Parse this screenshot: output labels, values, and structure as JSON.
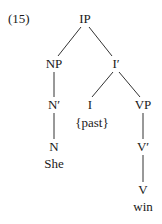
{
  "example_number": "(15)",
  "tree": {
    "nodes": {
      "IP": {
        "label": "IP",
        "x": 85,
        "y": 19
      },
      "NP": {
        "label": "NP",
        "x": 54,
        "y": 64
      },
      "Ibar": {
        "label": "I′",
        "x": 116,
        "y": 64
      },
      "Nbar": {
        "label": "N′",
        "x": 54,
        "y": 105
      },
      "I": {
        "label": "I",
        "x": 90,
        "y": 105
      },
      "VP": {
        "label": "VP",
        "x": 143,
        "y": 105
      },
      "past": {
        "label": "{past}",
        "x": 92,
        "y": 123
      },
      "N": {
        "label": "N",
        "x": 54,
        "y": 147
      },
      "She": {
        "label": "She",
        "x": 54,
        "y": 164
      },
      "Vbar": {
        "label": "V′",
        "x": 143,
        "y": 147
      },
      "V": {
        "label": "V",
        "x": 143,
        "y": 190
      },
      "win": {
        "label": "win",
        "x": 143,
        "y": 207
      }
    },
    "edges": [
      [
        "IP",
        "NP"
      ],
      [
        "IP",
        "Ibar"
      ],
      [
        "NP",
        "Nbar"
      ],
      [
        "Nbar",
        "N"
      ],
      [
        "Ibar",
        "I"
      ],
      [
        "Ibar",
        "VP"
      ],
      [
        "VP",
        "Vbar"
      ],
      [
        "Vbar",
        "V"
      ]
    ]
  }
}
